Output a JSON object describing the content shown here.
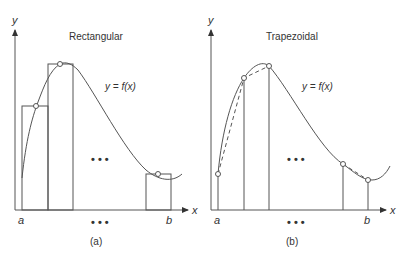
{
  "panels": [
    {
      "id": "a",
      "title": "Rectangular",
      "caption": "(a)",
      "function_label": "y = f(x)",
      "y_axis_label": "y",
      "x_axis_label": "x",
      "lower_bound": "a",
      "upper_bound": "b",
      "ellipsis": "• • •"
    },
    {
      "id": "b",
      "title": "Trapezoidal",
      "caption": "(b)",
      "function_label": "y = f(x)",
      "y_axis_label": "y",
      "x_axis_label": "x",
      "lower_bound": "a",
      "upper_bound": "b",
      "ellipsis": "• • •"
    }
  ],
  "colors": {
    "line": "#555555",
    "text": "#333333",
    "background": "#ffffff"
  }
}
